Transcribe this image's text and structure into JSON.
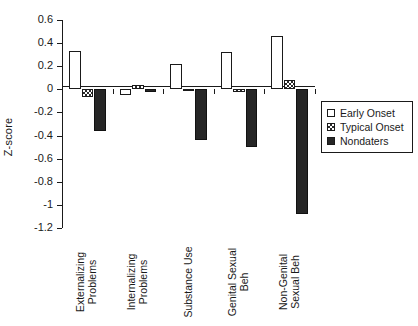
{
  "chart_data": {
    "type": "bar",
    "title": "",
    "xlabel": "",
    "ylabel": "Z-score",
    "ylim": [
      -1.2,
      0.6
    ],
    "yticks": [
      0.6,
      0.4,
      0.2,
      0,
      -0.2,
      -0.4,
      -0.6,
      -0.8,
      -1,
      -1.2
    ],
    "ytick_labels": [
      "0.6",
      "0.4",
      "0.2",
      "0",
      "-0.2",
      "-0.4",
      "-0.6",
      "-0.8",
      "-1",
      "-1.2"
    ],
    "grid": false,
    "legend_position": "right",
    "categories": [
      "Externalizing\nProblems",
      "Internalizing\nProblems",
      "Substance Use",
      "Genital Sexual\nBeh",
      "Non-Genital\nSexual Beh"
    ],
    "series": [
      {
        "name": "Early Onset",
        "fill": "white",
        "values": [
          0.33,
          -0.05,
          0.22,
          0.32,
          0.46
        ]
      },
      {
        "name": "Typical Onset",
        "fill": "hatched",
        "values": [
          -0.07,
          0.04,
          -0.01,
          -0.02,
          0.08
        ]
      },
      {
        "name": "Nondaters",
        "fill": "black",
        "values": [
          -0.36,
          -0.02,
          -0.44,
          -0.5,
          -1.08
        ]
      }
    ]
  },
  "legend": {
    "items": [
      {
        "label": "Early Onset",
        "swatch": "early"
      },
      {
        "label": "Typical Onset",
        "swatch": "typical"
      },
      {
        "label": "Nondaters",
        "swatch": "nondaters"
      }
    ]
  }
}
